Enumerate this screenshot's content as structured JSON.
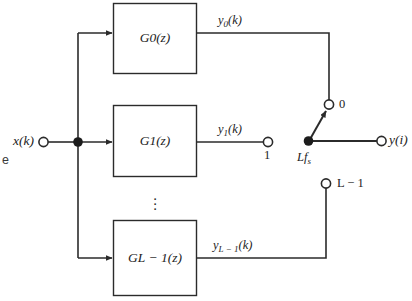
{
  "figure": {
    "type": "block-diagram",
    "stroke_color": "#2b2b2b",
    "text_color": "#1c1c1c",
    "background": "#ffffff"
  },
  "input": {
    "label_main": "x",
    "label_arg": "(k)",
    "terminal": "open-circle"
  },
  "caption_fragment": "e",
  "blocks": [
    {
      "id": "g0",
      "name": "G",
      "sub": "0",
      "arg": "(z)"
    },
    {
      "id": "g1",
      "name": "G",
      "sub": "1",
      "arg": "(z)"
    },
    {
      "id": "glm1",
      "name": "G",
      "sub": "L − 1",
      "arg": "(z)"
    }
  ],
  "ellipsis": "⋮",
  "outputs": [
    {
      "id": "y0",
      "name": "y",
      "sub": "0",
      "arg": "(k)"
    },
    {
      "id": "y1",
      "name": "y",
      "sub": "1",
      "arg": "(k)"
    },
    {
      "id": "ylm1",
      "name": "y",
      "sub": "L − 1",
      "arg": "(k)"
    }
  ],
  "switch": {
    "terminals": [
      {
        "id": "t0",
        "label": "0"
      },
      {
        "id": "t1",
        "label": "1"
      },
      {
        "id": "tlm1",
        "label": "L − 1"
      }
    ],
    "pivot_label_main": "Lf",
    "pivot_label_sub": "s",
    "selected_terminal": "0"
  },
  "output": {
    "label_main": "y",
    "label_arg": "(i)",
    "terminal": "open-circle"
  }
}
